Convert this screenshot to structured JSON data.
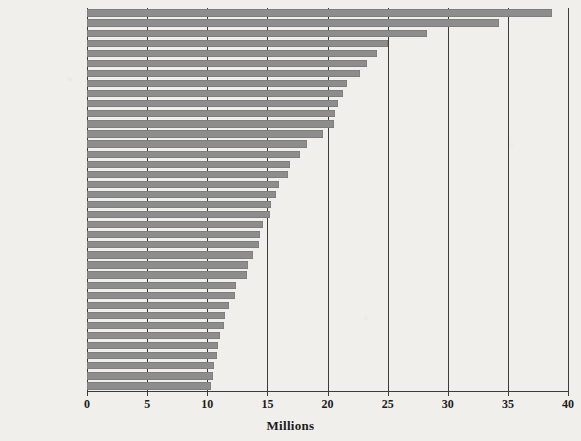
{
  "chart_data": {
    "type": "bar",
    "orientation": "horizontal",
    "title": "",
    "xlabel": "Millions",
    "ylabel": "",
    "xlim": [
      0,
      40
    ],
    "xticks": [
      0,
      5,
      10,
      15,
      20,
      25,
      30,
      35,
      40
    ],
    "grid": true,
    "legend": null,
    "bar_color": "#8d8d8d",
    "background_color": "#f1efeb",
    "axis_color": "#3b3b3b",
    "categories": [
      "Tokyo-Yokohama",
      "Jakarta",
      "Delhi, DL-UP-HR",
      "Manila",
      "Seoul-Incheon",
      "Mumbai, MH",
      "Shanghai, SHG-JS-ZJ",
      "New York, NY-NJ-CT",
      "Sao Paulo",
      "Mexico City",
      "Guangzhou-Foshan",
      "Beijing",
      "Dhaka",
      "Osaka-Kobe-Kyoto",
      "Cairo",
      "Moscow",
      "Bangkok",
      "Los Angeles",
      "Kolkata",
      "Buenos Aires",
      "Lagos",
      "Tehran",
      "Istanbul",
      "Karachi",
      "Shenzhen",
      "Tianjin",
      "Kinshasa",
      "Chengdu",
      "Rio de Janeiro",
      "Lahore",
      "Lima",
      "Bangalore",
      "Paris",
      "Ho Chi Minh City",
      "London",
      "Bogota",
      "Chennai",
      "Nagoya"
    ],
    "values": [
      38.7,
      34.3,
      28.3,
      25.0,
      24.1,
      23.3,
      22.7,
      21.6,
      21.3,
      20.9,
      20.6,
      20.5,
      19.6,
      18.3,
      17.7,
      16.9,
      16.7,
      16.0,
      15.7,
      15.3,
      15.2,
      14.6,
      14.4,
      14.3,
      13.8,
      13.4,
      13.3,
      12.4,
      12.3,
      11.8,
      11.5,
      11.4,
      11.1,
      10.9,
      10.8,
      10.6,
      10.5,
      10.3
    ]
  },
  "axis": {
    "x_title": "Millions",
    "tick_labels": [
      "0",
      "5",
      "10",
      "15",
      "20",
      "25",
      "30",
      "35",
      "40"
    ]
  }
}
